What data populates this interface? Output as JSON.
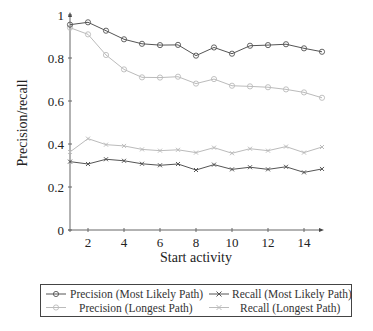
{
  "chart_data": {
    "type": "line",
    "title": "",
    "xlabel": "Start activity",
    "ylabel": "Precision/recall",
    "xlim": [
      1,
      15
    ],
    "ylim": [
      0,
      1
    ],
    "x": [
      1,
      2,
      3,
      4,
      5,
      6,
      7,
      8,
      9,
      10,
      11,
      12,
      13,
      14,
      15
    ],
    "xticks": [
      2,
      4,
      6,
      8,
      10,
      12,
      14
    ],
    "yticks": [
      0,
      0.2,
      0.4,
      0.6,
      0.8,
      1
    ],
    "ytick_labels": [
      "0",
      "0.2",
      "0.4",
      "0.6",
      "0.8",
      "1"
    ],
    "grid": false,
    "legend_position": "below",
    "series": [
      {
        "name": "Precision (Most Likely Path)",
        "color": "#555555",
        "marker": "circle",
        "values": [
          0.955,
          0.966,
          0.927,
          0.887,
          0.866,
          0.86,
          0.861,
          0.811,
          0.849,
          0.82,
          0.857,
          0.86,
          0.864,
          0.845,
          0.829
        ]
      },
      {
        "name": "Recall (Most Likely Path)",
        "color": "#555555",
        "marker": "x",
        "values": [
          0.318,
          0.307,
          0.329,
          0.322,
          0.308,
          0.301,
          0.307,
          0.279,
          0.304,
          0.282,
          0.292,
          0.282,
          0.294,
          0.268,
          0.284
        ]
      },
      {
        "name": "Precision (Longest Path)",
        "color": "#bbbbbb",
        "marker": "circle",
        "values": [
          0.941,
          0.91,
          0.814,
          0.747,
          0.71,
          0.709,
          0.713,
          0.681,
          0.702,
          0.671,
          0.668,
          0.664,
          0.654,
          0.64,
          0.615
        ]
      },
      {
        "name": "Recall (Longest Path)",
        "color": "#bbbbbb",
        "marker": "x",
        "values": [
          0.363,
          0.425,
          0.397,
          0.391,
          0.375,
          0.369,
          0.373,
          0.36,
          0.383,
          0.357,
          0.378,
          0.369,
          0.388,
          0.36,
          0.386
        ]
      }
    ]
  },
  "legend": {
    "items": [
      {
        "label": "Precision (Most Likely Path)"
      },
      {
        "label": "Recall (Most Likely Path)"
      },
      {
        "label": "Precision (Longest Path)"
      },
      {
        "label": "Recall (Longest Path)"
      }
    ]
  }
}
